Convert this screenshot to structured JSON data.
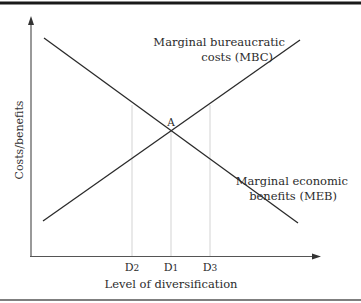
{
  "figure": {
    "y_axis_label": "Costs/benefits",
    "x_axis_label": "Level of diversification",
    "point_label": "A",
    "curves": {
      "mbc": {
        "label_line1": "Marginal bureaucratic",
        "label_line2": "costs (MBC)"
      },
      "meb": {
        "label_line1": "Marginal economic",
        "label_line2": "benefits (MEB)"
      }
    },
    "x_ticks": [
      {
        "label": "D2",
        "main": "D",
        "sub": "2"
      },
      {
        "label": "D1",
        "main": "D",
        "sub": "1"
      },
      {
        "label": "D3",
        "main": "D",
        "sub": "3"
      }
    ]
  },
  "colors": {
    "line": "#2a2a2a",
    "guide": "#c8c8c8",
    "border": "#1a1a1a"
  }
}
